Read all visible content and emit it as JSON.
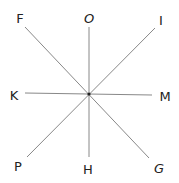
{
  "diagram": {
    "center": {
      "x": 89,
      "y": 94
    },
    "line_color": "#888888",
    "lines": [
      {
        "name": "line-O-H",
        "x1": 89,
        "y1": 27,
        "x2": 89,
        "y2": 157
      },
      {
        "name": "line-K-M",
        "x1": 25,
        "y1": 93,
        "x2": 152,
        "y2": 95
      },
      {
        "name": "line-F-G",
        "x1": 25,
        "y1": 27,
        "x2": 149,
        "y2": 158
      },
      {
        "name": "line-I-P",
        "x1": 155,
        "y1": 28,
        "x2": 27,
        "y2": 157
      }
    ],
    "labels": [
      {
        "text": "F",
        "x": 20,
        "y": 18
      },
      {
        "text": "O",
        "x": 89,
        "y": 18
      },
      {
        "text": "I",
        "x": 161,
        "y": 20
      },
      {
        "text": "K",
        "x": 14,
        "y": 95
      },
      {
        "text": "M",
        "x": 165,
        "y": 96
      },
      {
        "text": "P",
        "x": 18,
        "y": 166
      },
      {
        "text": "H",
        "x": 88,
        "y": 169
      },
      {
        "text": "G",
        "x": 159,
        "y": 168
      }
    ]
  }
}
